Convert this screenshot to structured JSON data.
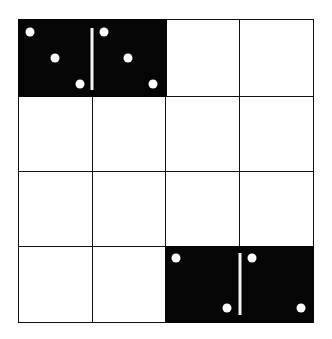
{
  "puzzle": {
    "rows": 4,
    "cols": 4,
    "colors": {
      "grid_line": "#111111",
      "cell_bg": "#ffffff",
      "domino_bg": "#050505",
      "pip": "#ffffff"
    },
    "dominoes": [
      {
        "row": 0,
        "col": 0,
        "orientation": "horizontal",
        "left_value": 3,
        "right_value": 3,
        "pattern": "diagonal-3"
      },
      {
        "row": 3,
        "col": 2,
        "orientation": "horizontal",
        "left_value": 2,
        "right_value": 2,
        "pattern": "diagonal-2"
      }
    ]
  }
}
